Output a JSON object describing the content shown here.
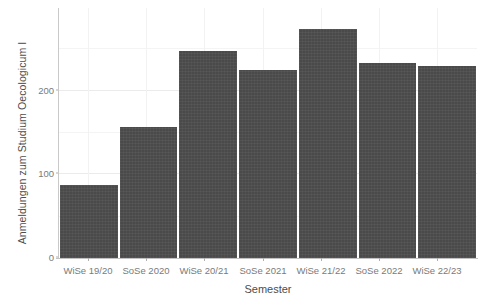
{
  "chart_data": {
    "type": "bar",
    "title": "",
    "subtitle": "",
    "xlabel": "Semester",
    "ylabel": "Anmeldungen zum Studium Oecologicum I",
    "categories": [
      "WiSe 19/20",
      "SoSe 2020",
      "WiSe 20/21",
      "SoSe 2021",
      "WiSe 21/22",
      "SoSe 2022",
      "WiSe 22/23"
    ],
    "values": [
      88,
      158,
      250,
      227,
      277,
      235,
      232
    ],
    "series": [
      {
        "name": "Anmeldungen zum Studium Oecologicum I",
        "values": [
          88,
          158,
          250,
          227,
          277,
          235,
          232
        ]
      }
    ],
    "ylim": [
      0,
      302
    ],
    "xlim_categories": 7,
    "y_ticks": [
      0,
      100,
      200
    ],
    "y_tick_labels": [
      "0",
      "100",
      "200"
    ],
    "grid": {
      "horizontal_major": true,
      "horizontal_minor": true,
      "vertical_major": true,
      "visible": true
    },
    "legend": {
      "visible": false,
      "position": "none",
      "entries": []
    },
    "annotations": [],
    "colors": {
      "bar_fill": "#4a4a4a",
      "panel_background": "#ffffff",
      "grid_major": "#ebebeb",
      "grid_minor": "#f4f4f4",
      "axis_line": "#c2c2c2",
      "tick_label": "#7a7a7a",
      "axis_title": "#4d4d4d"
    }
  },
  "axes": {
    "y_title": "Anmeldungen zum Studium Oecologicum I",
    "x_title": "Semester",
    "y_tick_labels": [
      "200",
      "100",
      "0"
    ],
    "x_tick_labels": [
      "WiSe 19/20",
      "SoSe 2020",
      "WiSe 20/21",
      "SoSe 2021",
      "WiSe 21/22",
      "SoSe 2022",
      "WiSe 22/23"
    ]
  }
}
